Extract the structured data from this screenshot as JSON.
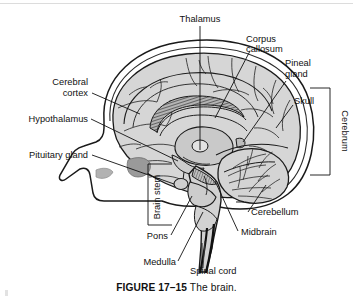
{
  "figure": {
    "number": "FIGURE 17–15",
    "title": "The brain."
  },
  "colors": {
    "skull_outline": "#ffffff",
    "cortex_fill": "#d6d6d6",
    "inner_structure_fill": "#c9c9c9",
    "dark_shading": "#9a9a9a",
    "line": "#111111",
    "background": "#ffffff"
  },
  "labels": {
    "thalamus": "Thalamus",
    "corpus_callosum_line1": "Corpus",
    "corpus_callosum_line2": "callosum",
    "pineal_gland_line1": "Pineal",
    "pineal_gland_line2": "gland",
    "skull": "Skull",
    "cerebrum": "Cerebrum",
    "cerebral_cortex_line1": "Cerebral",
    "cerebral_cortex_line2": "cortex",
    "hypothalamus": "Hypothalamus",
    "pituitary_gland": "Pituitary gland",
    "brain_stem": "Brain stem",
    "pons": "Pons",
    "medulla": "Medulla",
    "spinal_cord": "Spinal cord",
    "midbrain": "Midbrain",
    "cerebellum": "Cerebellum"
  },
  "structures": [
    "cerebrum",
    "cerebral cortex",
    "corpus callosum",
    "thalamus",
    "hypothalamus",
    "pineal gland",
    "pituitary gland",
    "midbrain",
    "pons",
    "medulla",
    "cerebellum",
    "spinal cord",
    "brain stem",
    "skull"
  ]
}
